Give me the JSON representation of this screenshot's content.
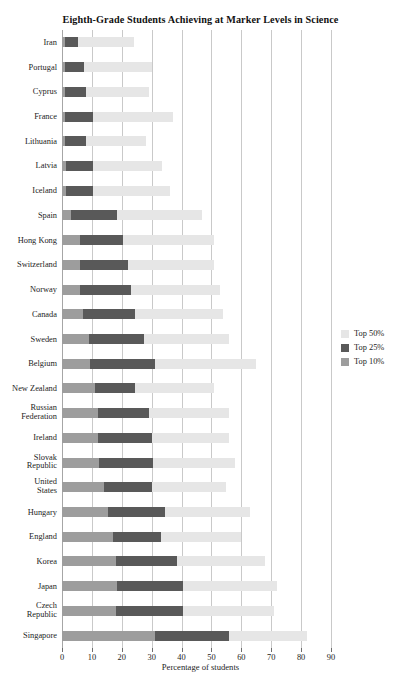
{
  "chart_data": {
    "type": "bar",
    "orientation": "horizontal",
    "title": "Eighth-Grade Students Achieving at Marker Levels in Science",
    "xlabel": "Percentage of students",
    "ylabel": "",
    "xlim": [
      0,
      90
    ],
    "xticks": [
      0,
      10,
      20,
      30,
      40,
      50,
      60,
      70,
      80,
      90
    ],
    "xtick_labels": [
      "0",
      "10",
      "20",
      "30",
      "40",
      "50",
      "60",
      "70",
      "80",
      "90"
    ],
    "grid": true,
    "grid_axis": "x",
    "legend_position": "right",
    "stacked": false,
    "overlaid": true,
    "categories": [
      "Iran",
      "Portugal",
      "Cyprus",
      "France",
      "Lithuania",
      "Latvia",
      "Iceland",
      "Spain",
      "Hong Kong",
      "Switzerland",
      "Norway",
      "Canada",
      "Sweden",
      "Belgium",
      "New Zealand",
      "Russian Federation",
      "Ireland",
      "Slovak Republic",
      "United States",
      "Hungary",
      "England",
      "Korea",
      "Japan",
      "Czech Republic",
      "Singapore"
    ],
    "category_lines": [
      [
        "Iran"
      ],
      [
        "Portugal"
      ],
      [
        "Cyprus"
      ],
      [
        "France"
      ],
      [
        "Lithuania"
      ],
      [
        "Latvia"
      ],
      [
        "Iceland"
      ],
      [
        "Spain"
      ],
      [
        "Hong Kong"
      ],
      [
        "Switzerland"
      ],
      [
        "Norway"
      ],
      [
        "Canada"
      ],
      [
        "Sweden"
      ],
      [
        "Belgium"
      ],
      [
        "New Zealand"
      ],
      [
        "Russian",
        "Federation"
      ],
      [
        "Ireland"
      ],
      [
        "Slovak",
        "Republic"
      ],
      [
        "United",
        "States"
      ],
      [
        "Hungary"
      ],
      [
        "England"
      ],
      [
        "Korea"
      ],
      [
        "Japan"
      ],
      [
        "Czech",
        "Republic"
      ],
      [
        "Singapore"
      ]
    ],
    "series": [
      {
        "name": "Top 50%",
        "color": "#e6e6e6",
        "values": [
          24,
          30,
          29,
          37,
          28,
          33.5,
          36,
          47,
          51,
          51,
          53,
          54,
          56,
          65,
          51,
          56,
          56,
          58,
          55,
          63,
          60,
          68,
          72,
          71,
          82
        ]
      },
      {
        "name": "Top 25%",
        "color": "#595959",
        "values": [
          5.5,
          7.5,
          8,
          10.5,
          8,
          10.5,
          10.5,
          18.5,
          20.5,
          22,
          23,
          24.5,
          27.5,
          31,
          24.5,
          29,
          30,
          30.5,
          30,
          34.5,
          33,
          38.5,
          40.5,
          40.5,
          56
        ]
      },
      {
        "name": "Top 10%",
        "color": "#9d9d9d",
        "values": [
          1,
          1,
          1,
          1,
          1,
          1.2,
          1.5,
          3,
          6,
          6,
          6,
          7,
          9,
          9.5,
          11,
          12,
          12,
          12.5,
          14,
          15.5,
          17,
          18,
          18.5,
          18,
          31
        ]
      }
    ]
  },
  "legend": {
    "items": [
      {
        "label": "Top 50%",
        "color": "#e6e6e6"
      },
      {
        "label": "Top 25%",
        "color": "#595959"
      },
      {
        "label": "Top 10%",
        "color": "#9d9d9d"
      }
    ]
  }
}
